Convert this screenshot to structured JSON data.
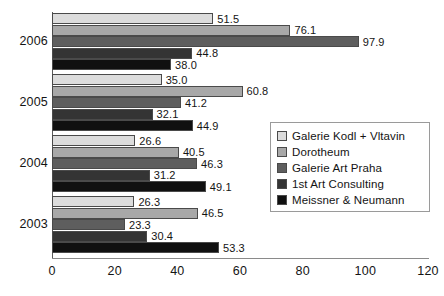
{
  "chart_data": {
    "type": "bar",
    "orientation": "horizontal",
    "title": "",
    "xlabel": "",
    "ylabel": "",
    "xlim": [
      0,
      120
    ],
    "xticks": [
      "0",
      "20",
      "40",
      "60",
      "80",
      "100",
      "120"
    ],
    "grid": false,
    "legend_position": "center-right",
    "categories": [
      "2006",
      "2005",
      "2004",
      "2003"
    ],
    "series": [
      {
        "name": "Galerie Kodl + Vltavin",
        "color": "#dcdcdc",
        "values": [
          51.5,
          35.0,
          26.6,
          26.3
        ],
        "labels": [
          "51.5",
          "35.0",
          "26.6",
          "26.3"
        ]
      },
      {
        "name": "Dorotheum",
        "color": "#a8a8a8",
        "values": [
          76.1,
          60.8,
          40.5,
          46.5
        ],
        "labels": [
          "76.1",
          "60.8",
          "40.5",
          "46.5"
        ]
      },
      {
        "name": "Galerie Art Praha",
        "color": "#5e5e5e",
        "values": [
          97.9,
          41.2,
          46.3,
          23.3
        ],
        "labels": [
          "97.9",
          "41.2",
          "46.3",
          "23.3"
        ]
      },
      {
        "name": "1st Art Consulting",
        "color": "#343434",
        "values": [
          44.8,
          32.1,
          31.2,
          30.4
        ],
        "labels": [
          "44.8",
          "32.1",
          "31.2",
          "30.4"
        ]
      },
      {
        "name": "Meissner & Neumann",
        "color": "#101010",
        "values": [
          38.0,
          44.9,
          49.1,
          53.3
        ],
        "labels": [
          "38.0",
          "44.9",
          "49.1",
          "53.3"
        ]
      }
    ]
  },
  "legend": {
    "items": [
      {
        "label": "Galerie Kodl + Vltavin",
        "color": "#dcdcdc"
      },
      {
        "label": "Dorotheum",
        "color": "#a8a8a8"
      },
      {
        "label": "Galerie Art Praha",
        "color": "#5e5e5e"
      },
      {
        "label": "1st Art Consulting",
        "color": "#343434"
      },
      {
        "label": "Meissner & Neumann",
        "color": "#101010"
      }
    ]
  }
}
